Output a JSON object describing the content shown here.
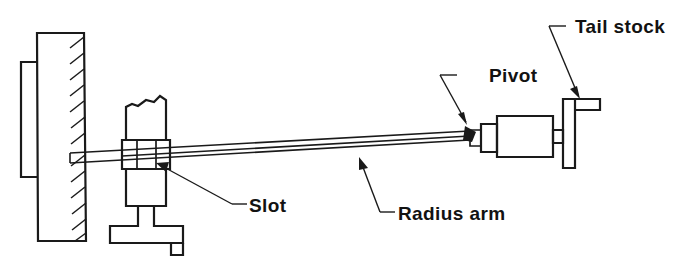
{
  "figure": {
    "kind": "engineering-line-drawing",
    "background_color": "#ffffff",
    "line_color": "#1a1a1a"
  },
  "labels": {
    "pivot": "Pivot",
    "tail_stock": "Tail stock",
    "slot": "Slot",
    "radius_arm": "Radius arm"
  },
  "parts": {
    "wall": "wall-block",
    "wall_bracket": "wall-side-plate",
    "post": "slotted-post",
    "post_base": "post-t-base",
    "arm": "radius-arm-bar",
    "pivot_joint": "pivot-joint",
    "collar": "spindle-collar",
    "cylinder": "tail-stock-cylinder",
    "tail_plate": "tail-stock-plate",
    "tail_tab": "tail-stock-top-tab"
  },
  "geometry": {
    "width": 692,
    "height": 277,
    "hatch_count": 13,
    "arm_from_x": 70,
    "arm_to_x": 470
  }
}
